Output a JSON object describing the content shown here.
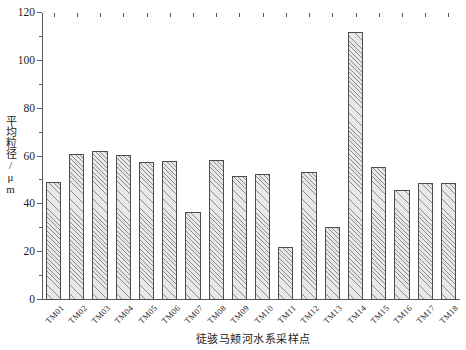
{
  "chart_data": {
    "type": "bar",
    "title": "",
    "xlabel": "徒骇马颊河水系采样点",
    "ylabel": "平均粒径/μm",
    "ylim": [
      0,
      120
    ],
    "yticks": [
      0,
      20,
      40,
      60,
      80,
      100,
      120
    ],
    "ytick_labels": [
      "0",
      "20",
      "40",
      "60",
      "80",
      "100",
      "120"
    ],
    "yminor_ticks": [
      10,
      30,
      50,
      70,
      90,
      110
    ],
    "grid": false,
    "legend": null,
    "bar_style": {
      "fill": "#e8e8e8",
      "hatch": "///",
      "hatch_color": "#8d8d8d",
      "edge_color": "#4d4d4d"
    },
    "categories": [
      "TM01",
      "TM02",
      "TM03",
      "TM04",
      "TM05",
      "TM06",
      "TM07",
      "TM08",
      "TM09",
      "TM10",
      "TM11",
      "TM12",
      "TM13",
      "TM14",
      "TM15",
      "TM16",
      "TM17",
      "TM18"
    ],
    "values": [
      49.5,
      61,
      62.5,
      60.5,
      57.5,
      58,
      37,
      58.5,
      52,
      52.5,
      22,
      53.5,
      30.5,
      112,
      55.5,
      46,
      49,
      49
    ]
  }
}
